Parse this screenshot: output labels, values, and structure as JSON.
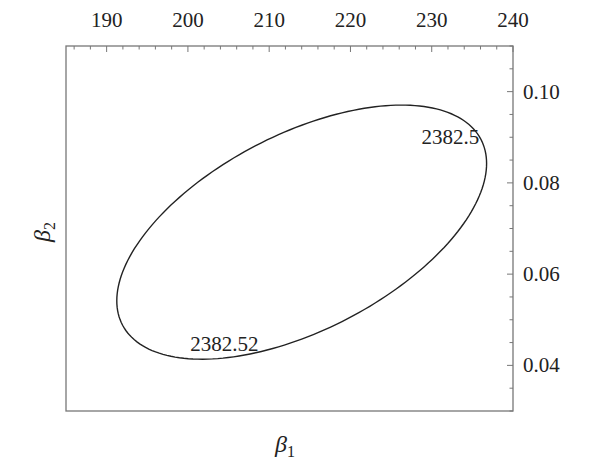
{
  "chart_data": {
    "type": "contour",
    "title": "",
    "xlabel": "β1",
    "ylabel": "β2",
    "xlabel_parts": {
      "base": "β",
      "sub": "1"
    },
    "ylabel_parts": {
      "base": "β",
      "sub": "2"
    },
    "xlim": [
      185,
      240
    ],
    "ylim": [
      0.03,
      0.11
    ],
    "x_ticks": [
      190,
      200,
      210,
      220,
      230,
      240
    ],
    "x_tick_labels": [
      "190",
      "200",
      "210",
      "220",
      "230",
      "240"
    ],
    "x_axis_position": "top",
    "y_ticks": [
      0.04,
      0.06,
      0.08,
      0.1
    ],
    "y_tick_labels": [
      "0.04",
      "0.06",
      "0.08",
      "0.10"
    ],
    "y_axis_position": "right",
    "grid": false,
    "contours": [
      {
        "level": "2382.52",
        "shape": "ellipse",
        "center": [
          214.0,
          0.0692
        ],
        "x_extent": [
          191.2,
          236.7
        ],
        "y_extent": [
          0.0413,
          0.097
        ],
        "orientation": "tilted, positive correlation"
      }
    ],
    "annotations": [
      {
        "text": "2382.5",
        "x": 232.3,
        "y": 0.0885
      },
      {
        "text": "2382.52",
        "x": 204.5,
        "y": 0.0431
      }
    ],
    "line_color": "#222222"
  }
}
